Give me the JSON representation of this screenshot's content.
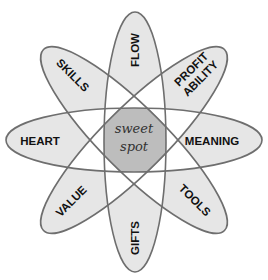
{
  "diagram": {
    "type": "venn-atom",
    "center_label_line1": "sweet",
    "center_label_line2": "spot",
    "petals": [
      {
        "label": "FLOW",
        "angle": 90
      },
      {
        "label_line1": "PROFIT",
        "label_line2": "ABILITY",
        "angle": 45
      },
      {
        "label": "MEANING",
        "angle": 0
      },
      {
        "label": "TOOLS",
        "angle": -45
      },
      {
        "label": "GIFTS",
        "angle": -90
      },
      {
        "label": "VALUE",
        "angle": 225
      },
      {
        "label": "HEART",
        "angle": 180
      },
      {
        "label": "SKILLS",
        "angle": 135
      }
    ],
    "colors": {
      "petal_fill": "#e6e6e6",
      "overlap_fill": "#ffffff",
      "center_fill": "#bdbdbd",
      "stroke": "#6e6e6e",
      "text": "#111111"
    }
  }
}
